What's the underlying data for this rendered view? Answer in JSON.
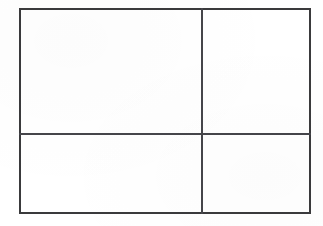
{
  "diagram": {
    "name": "four-cell-grid",
    "background_color": "#ffffff",
    "line_color": "#3a3a3c",
    "divider_color": "#45454a",
    "frame": {
      "left": 19,
      "top": 8,
      "width": 292,
      "height": 206
    },
    "dividers": {
      "vertical_x": 182,
      "horizontal_y": 125
    },
    "cells": [
      {
        "id": "cell-top-left",
        "label": "",
        "left": 0,
        "top": 0,
        "width": 182,
        "height": 125
      },
      {
        "id": "cell-top-right",
        "label": "",
        "left": 183,
        "top": 0,
        "width": 109,
        "height": 125
      },
      {
        "id": "cell-bottom-left",
        "label": "",
        "left": 0,
        "top": 126,
        "width": 182,
        "height": 80
      },
      {
        "id": "cell-bottom-right",
        "label": "",
        "left": 183,
        "top": 126,
        "width": 109,
        "height": 80
      }
    ]
  }
}
